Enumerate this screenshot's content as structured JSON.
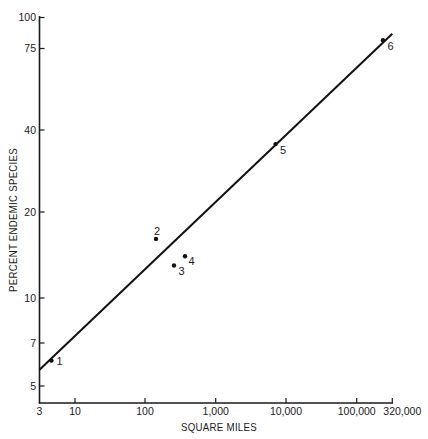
{
  "chart_data": {
    "type": "scatter",
    "title": "",
    "xlabel": "SQUARE MILES",
    "ylabel": "PERCENT ENDEMIC SPECIES",
    "xscale": "log",
    "yscale": "log",
    "xlim": [
      3,
      320000
    ],
    "ylim": [
      4.2,
      100
    ],
    "grid": false,
    "legend": null,
    "xticks": [
      {
        "value": 3,
        "label": "3"
      },
      {
        "value": 10,
        "label": "10"
      },
      {
        "value": 100,
        "label": "100"
      },
      {
        "value": 1000,
        "label": "1,000"
      },
      {
        "value": 10000,
        "label": "10,000"
      },
      {
        "value": 100000,
        "label": "100,000"
      },
      {
        "value": 320000,
        "label": "320,000"
      }
    ],
    "yticks": [
      {
        "value": 5,
        "label": "5"
      },
      {
        "value": 7,
        "label": "7"
      },
      {
        "value": 10,
        "label": "10"
      },
      {
        "value": 20,
        "label": "20"
      },
      {
        "value": 40,
        "label": "40"
      },
      {
        "value": 75,
        "label": "75"
      },
      {
        "value": 100,
        "label": "100"
      }
    ],
    "series": [
      {
        "name": "areas",
        "points": [
          {
            "label": "1",
            "x": 4.5,
            "y": 6.1,
            "label_pos": "right"
          },
          {
            "label": "2",
            "x": 143,
            "y": 16.1,
            "label_pos": "above"
          },
          {
            "label": "3",
            "x": 257,
            "y": 13.0,
            "label_pos": "below-right"
          },
          {
            "label": "4",
            "x": 368,
            "y": 14.0,
            "label_pos": "right-below"
          },
          {
            "label": "5",
            "x": 7100,
            "y": 35.5,
            "label_pos": "below-right"
          },
          {
            "label": "6",
            "x": 236000,
            "y": 81,
            "label_pos": "below-right"
          }
        ]
      }
    ],
    "fit_line": {
      "type": "linear on log-log axes",
      "from": {
        "x": 3,
        "y": 5.7
      },
      "to": {
        "x": 320000,
        "y": 86
      }
    },
    "colors": {
      "ink": "#111111",
      "background": "#ffffff"
    }
  }
}
